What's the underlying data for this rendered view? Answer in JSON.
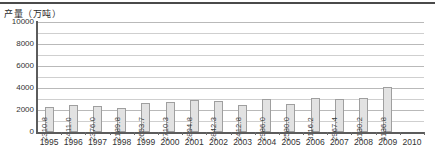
{
  "chart_data": {
    "type": "bar",
    "title": "",
    "ylabel": "产量（万吨）",
    "xlabel": "",
    "ylim": [
      0,
      10000
    ],
    "ytick_labels": [
      "0",
      "2000",
      "4000",
      "6000",
      "8000",
      "10000"
    ],
    "ytick_values": [
      0,
      2000,
      4000,
      6000,
      8000,
      10000
    ],
    "gridlines": [
      1000,
      2000,
      3000,
      4000,
      5000,
      6000,
      7000,
      8000,
      9000,
      10000
    ],
    "grid": true,
    "legend": "none",
    "axis_years": [
      "1995",
      "1996",
      "1997",
      "1998",
      "1999",
      "2000",
      "2001",
      "2002",
      "2003",
      "2004",
      "2005",
      "2006",
      "2007",
      "2008",
      "2009",
      "2010"
    ],
    "categories": [
      "1995",
      "1996",
      "1997",
      "1998",
      "1999",
      "2000",
      "2001",
      "2002",
      "2003",
      "2004",
      "2005",
      "2006",
      "2007",
      "2008",
      "2009"
    ],
    "values": [
      2310.8,
      2411.0,
      2376.0,
      2189.8,
      2653.7,
      2710.3,
      2894.8,
      2842.3,
      2412.8,
      2986.0,
      2580.0,
      3116.2,
      2967.4,
      3130.2,
      4136.8
    ],
    "data_labels": [
      "2310.8",
      "2411.0",
      "2376.0",
      "2189.8",
      "2653.7",
      "2710.3",
      "2894.8",
      "2842.3",
      "2412.8",
      "2986.0",
      "2580.0",
      "3116.2",
      "2967.4",
      "3130.2",
      "4136.8"
    ],
    "bar_color": "#e2e2e2",
    "bar_border_color": "#9f9f9f",
    "grid_color": "#b9b9b9",
    "axis_color": "#5c5c5c"
  }
}
